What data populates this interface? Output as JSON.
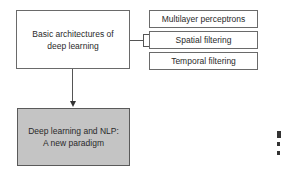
{
  "diagram": {
    "main_node": {
      "label_line1": "Basic architectures of",
      "label_line2": "deep learning"
    },
    "sub_nodes": [
      {
        "label": "Multilayer perceptrons"
      },
      {
        "label": "Spatial filtering"
      },
      {
        "label": "Temporal filtering"
      }
    ],
    "result_node": {
      "label_line1": "Deep learning and NLP:",
      "label_line2": "A new paradigm",
      "fill": "#c4c4c4"
    },
    "edges": [
      {
        "from": "main_node",
        "to": "sub_nodes",
        "type": "bracket"
      },
      {
        "from": "main_node",
        "to": "result_node",
        "type": "arrow"
      }
    ]
  }
}
